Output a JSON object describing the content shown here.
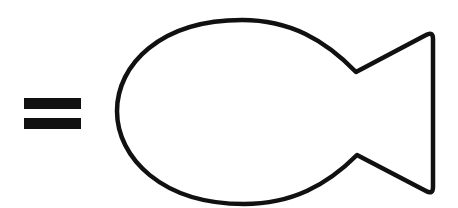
{
  "figure": {
    "elements": [
      {
        "type": "equals-sign",
        "color": "#111111"
      },
      {
        "type": "fish-outline",
        "stroke": "#111111",
        "fill": "#ffffff"
      }
    ]
  },
  "colors": {
    "background": "#ffffff",
    "ink": "#111111"
  }
}
